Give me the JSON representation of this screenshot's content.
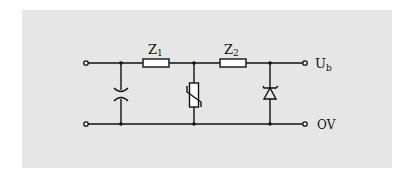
{
  "diagram": {
    "type": "circuit-schematic",
    "background_color": "#e6e6e6",
    "line_color": "#111111",
    "components": [
      {
        "id": "C",
        "kind": "capacitor-varactor",
        "label": ""
      },
      {
        "id": "Z1",
        "kind": "resistor",
        "label": "Z",
        "subscript": "1"
      },
      {
        "id": "VDR",
        "kind": "varistor",
        "label": ""
      },
      {
        "id": "Z2",
        "kind": "resistor",
        "label": "Z",
        "subscript": "2"
      },
      {
        "id": "D",
        "kind": "zener-diode",
        "label": ""
      }
    ],
    "terminals": {
      "output_top": {
        "label": "U",
        "subscript": "b"
      },
      "output_bottom": {
        "label": "OV"
      }
    }
  }
}
